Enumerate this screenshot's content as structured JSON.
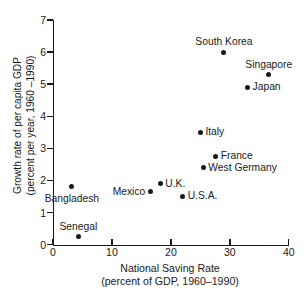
{
  "chart_data": {
    "type": "scatter",
    "title": "",
    "xlabel": "National Saving Rate\n(percent of GDP, 1960–1990)",
    "ylabel": "Growth rate of per capita GDP\n(percent per year, 1960 –1990)",
    "xlim": [
      0,
      40
    ],
    "ylim": [
      0,
      7
    ],
    "grid": false,
    "legend": "none",
    "xticks": [
      "0",
      "10",
      "20",
      "30",
      "40"
    ],
    "xtick_values": [
      0,
      10,
      20,
      30,
      40
    ],
    "yticks": [
      "0",
      "1",
      "2",
      "3",
      "4",
      "5",
      "6",
      "7"
    ],
    "ytick_values": [
      0,
      1,
      2,
      3,
      4,
      5,
      6,
      7
    ],
    "marker_color": "#1a1a1a",
    "axis_color": "#1a1a1a",
    "points": [
      {
        "label": "South Korea",
        "x": 29.0,
        "y": 6.0,
        "label_pos": "above"
      },
      {
        "label": "Singapore",
        "x": 36.6,
        "y": 5.3,
        "label_pos": "above"
      },
      {
        "label": "Japan",
        "x": 33.0,
        "y": 4.9,
        "label_pos": "right"
      },
      {
        "label": "Italy",
        "x": 25.0,
        "y": 3.5,
        "label_pos": "right"
      },
      {
        "label": "France",
        "x": 27.6,
        "y": 2.75,
        "label_pos": "right"
      },
      {
        "label": "West Germany",
        "x": 25.5,
        "y": 2.4,
        "label_pos": "right"
      },
      {
        "label": "U.K.",
        "x": 18.2,
        "y": 1.9,
        "label_pos": "right"
      },
      {
        "label": "Mexico",
        "x": 16.5,
        "y": 1.65,
        "label_pos": "left"
      },
      {
        "label": "U.S.A.",
        "x": 22.0,
        "y": 1.5,
        "label_pos": "right"
      },
      {
        "label": "Bangladesh",
        "x": 3.2,
        "y": 1.8,
        "label_pos": "below"
      },
      {
        "label": "Senegal",
        "x": 4.3,
        "y": 0.25,
        "label_pos": "above"
      }
    ]
  }
}
